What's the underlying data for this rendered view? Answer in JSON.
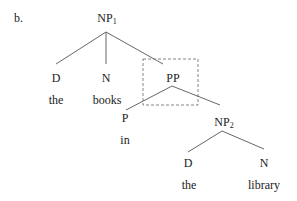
{
  "example_label": "b.",
  "colors": {
    "line": "#555555",
    "text": "#222222",
    "dashed_box": "#777777"
  },
  "tree": {
    "root": {
      "label": "NP",
      "subscript": "1"
    },
    "d1": {
      "label": "D",
      "word": "the"
    },
    "n1": {
      "label": "N",
      "word": "books"
    },
    "pp": {
      "label": "PP",
      "highlighted": "dashed-box"
    },
    "p": {
      "label": "P",
      "word": "in"
    },
    "np2": {
      "label": "NP",
      "subscript": "2"
    },
    "d2": {
      "label": "D",
      "word": "the"
    },
    "n2": {
      "label": "N",
      "word": "library"
    }
  }
}
